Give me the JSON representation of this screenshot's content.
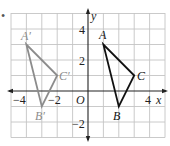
{
  "figure": {
    "bullet": "•",
    "axes": {
      "x_label": "x",
      "y_label": "y",
      "origin_label": "O",
      "x_ticks": [
        {
          "value": -4,
          "label": "−4"
        },
        {
          "value": -2,
          "label": "−2"
        },
        {
          "value": 4,
          "label": "4"
        }
      ],
      "y_ticks": [
        {
          "value": 4,
          "label": "4"
        },
        {
          "value": 2,
          "label": "2"
        },
        {
          "value": -2,
          "label": "−2"
        }
      ],
      "x_range": [
        -5,
        5
      ],
      "y_range": [
        -3,
        5
      ]
    },
    "triangles": [
      {
        "name": "ABC",
        "color": "#111111",
        "vertices": [
          {
            "label": "A",
            "x": 1,
            "y": 3
          },
          {
            "label": "B",
            "x": 2,
            "y": -1
          },
          {
            "label": "C",
            "x": 3,
            "y": 1
          }
        ]
      },
      {
        "name": "A'B'C'",
        "color": "#8c8c8c",
        "vertices": [
          {
            "label": "A′",
            "x": -4,
            "y": 3
          },
          {
            "label": "B′",
            "x": -3,
            "y": -1
          },
          {
            "label": "C′",
            "x": -2,
            "y": 1
          }
        ]
      }
    ],
    "colors": {
      "grid": "#bdbdbd",
      "axis": "#222222",
      "image_triangle": "#8c8c8c",
      "preimage_triangle": "#111111"
    }
  }
}
